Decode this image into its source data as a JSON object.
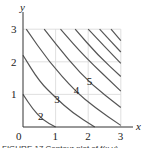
{
  "chart_data": {
    "type": "line",
    "title": "",
    "subtitle": "Contour plot (level curves)",
    "xlabel": "x",
    "ylabel": "y",
    "xlim": [
      0,
      3
    ],
    "ylim": [
      0,
      3
    ],
    "grid": true,
    "x_ticks": [
      "0",
      "1",
      "2",
      "3"
    ],
    "y_ticks": [
      "1",
      "2",
      "3"
    ],
    "origin_label": "0",
    "series": [
      {
        "name": "2",
        "points": [
          [
            0,
            1
          ],
          [
            0.3,
            0.55
          ],
          [
            0.6,
            0.22
          ],
          [
            1,
            0
          ]
        ]
      },
      {
        "name": "3",
        "points": [
          [
            0,
            2.2
          ],
          [
            0.5,
            1.4
          ],
          [
            1,
            0.9
          ],
          [
            1.5,
            0.45
          ],
          [
            2.2,
            0
          ]
        ]
      },
      {
        "name": "4",
        "points": [
          [
            0.1,
            3
          ],
          [
            0.8,
            2
          ],
          [
            1.6,
            1.1
          ],
          [
            2.2,
            0.6
          ],
          [
            3,
            0.05
          ]
        ]
      },
      {
        "name": "5",
        "points": [
          [
            0.65,
            3
          ],
          [
            1.4,
            2.05
          ],
          [
            2.1,
            1.3
          ],
          [
            3,
            0.6
          ]
        ]
      },
      {
        "name": "6",
        "points": [
          [
            1.15,
            3
          ],
          [
            1.9,
            2.15
          ],
          [
            3,
            1.1
          ]
        ]
      },
      {
        "name": "7",
        "points": [
          [
            1.6,
            3
          ],
          [
            2.3,
            2.2
          ],
          [
            3,
            1.55
          ]
        ]
      },
      {
        "name": "8",
        "points": [
          [
            2.0,
            3
          ],
          [
            3,
            1.95
          ]
        ]
      },
      {
        "name": "9",
        "points": [
          [
            2.35,
            3
          ],
          [
            3,
            2.3
          ]
        ]
      },
      {
        "name": "10",
        "points": [
          [
            2.7,
            3
          ],
          [
            3,
            2.65
          ]
        ]
      }
    ],
    "annotations": [
      {
        "text": "2",
        "x": 0.55,
        "y": 0.35
      },
      {
        "text": "3",
        "x": 1.05,
        "y": 0.85
      },
      {
        "text": "4",
        "x": 1.65,
        "y": 1.15
      },
      {
        "text": "5",
        "x": 2.05,
        "y": 1.4
      }
    ]
  },
  "caption": "FIGURE 17 Contour plot of f(x,y)"
}
